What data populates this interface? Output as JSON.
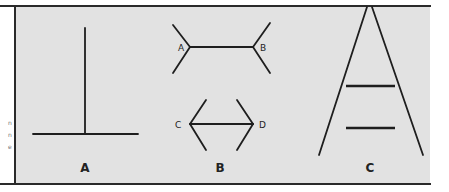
{
  "figure": {
    "colors": {
      "background": "#e2e2e2",
      "line": "#1e1e1e",
      "border": "#2a2a2a"
    },
    "left_margin_fragments": [
      "n",
      "n",
      "e"
    ],
    "panels": [
      {
        "id": "A",
        "label": "A",
        "illusion": "vertical-horizontal"
      },
      {
        "id": "B",
        "label": "B",
        "illusion": "muller-lyer",
        "top_figure": {
          "left_endpoint_label": "A",
          "right_endpoint_label": "B"
        },
        "bottom_figure": {
          "left_endpoint_label": "C",
          "right_endpoint_label": "D"
        }
      },
      {
        "id": "C",
        "label": "C",
        "illusion": "ponzo"
      }
    ]
  }
}
